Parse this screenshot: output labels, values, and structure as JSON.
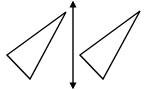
{
  "diagram": {
    "type": "geometry-transformation",
    "colors": {
      "stroke": "#000000",
      "background": "#ffffff"
    },
    "axis_line": {
      "x": 73,
      "y1": 2,
      "y2": 88,
      "arrows": "both"
    },
    "triangles": [
      {
        "name": "left-triangle",
        "points": "7,55 66,12 30,79"
      },
      {
        "name": "right-triangle",
        "points": "80,55 140,11 103,79"
      }
    ]
  }
}
